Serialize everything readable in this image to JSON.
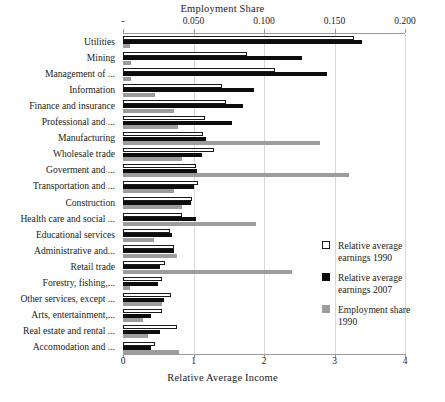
{
  "chart_data": {
    "type": "bar",
    "orientation": "horizontal",
    "title": "",
    "top_axis_label": "Employment Share",
    "bottom_axis_label": "Relative Average Income",
    "top_axis_ticks": [
      "-",
      "0.050",
      "0.100",
      "0.150",
      "0.200"
    ],
    "top_axis_tick_values": [
      0,
      0.05,
      0.1,
      0.15,
      0.2
    ],
    "bottom_axis_ticks": [
      "0",
      "1",
      "2",
      "3",
      "4"
    ],
    "bottom_axis_tick_values": [
      0,
      1,
      2,
      3,
      4
    ],
    "xlim_income": [
      0,
      4
    ],
    "xlim_share": [
      0,
      0.2
    ],
    "grid": true,
    "legend_position": "right",
    "categories": [
      "Utilities",
      "Mining",
      "Management of ...",
      "Information",
      "Finance and insurance",
      "Professional and ...",
      "Manufacturing",
      "Wholesale trade",
      "Goverment and ...",
      "Transportation and ...",
      "Construction",
      "Health care and social ...",
      "Educational services",
      "Administrative and...",
      "Retail trade",
      "Forestry, fishing,...",
      "Other services, except ...",
      "Arts, entertainment,...",
      "Real estate and rental ...",
      "Accomodation and ..."
    ],
    "series": [
      {
        "name": "Relative average earnings 1990",
        "key": "earn1990",
        "color": "#ffffff",
        "axis": "bottom",
        "values": [
          3.28,
          1.76,
          2.15,
          1.4,
          1.46,
          1.17,
          1.14,
          1.29,
          1.03,
          1.06,
          0.98,
          0.83,
          0.66,
          0.72,
          0.6,
          0.56,
          0.68,
          0.56,
          0.76,
          0.45
        ]
      },
      {
        "name": "Relative average earnings 2007",
        "key": "earn2007",
        "color": "#0d0d0d",
        "axis": "bottom",
        "values": [
          3.39,
          2.54,
          2.89,
          1.86,
          1.7,
          1.54,
          1.18,
          1.12,
          1.05,
          1.0,
          0.97,
          1.04,
          0.7,
          0.72,
          0.52,
          0.5,
          0.58,
          0.4,
          0.53,
          0.4
        ]
      },
      {
        "name": "Employment share 1990",
        "key": "share1990",
        "color": "#9d9d9d",
        "axis": "top",
        "values": [
          0.005,
          0.006,
          0.006,
          0.023,
          0.036,
          0.039,
          0.14,
          0.042,
          0.16,
          0.036,
          0.042,
          0.094,
          0.022,
          0.038,
          0.12,
          0.005,
          0.028,
          0.014,
          0.018,
          0.04
        ]
      }
    ]
  },
  "legend": {
    "items": [
      {
        "label_line1": "Relative average",
        "label_line2": "earnings 1990",
        "swatch": "white"
      },
      {
        "label_line1": "Relative average",
        "label_line2": "earnings 2007",
        "swatch": "black"
      },
      {
        "label_line1": "Employment share",
        "label_line2": "1990",
        "swatch": "gray"
      }
    ]
  },
  "caption": {
    "text": ""
  }
}
